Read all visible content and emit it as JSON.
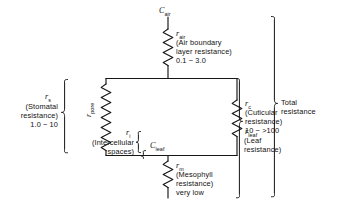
{
  "diagram": {
    "line_color": "#151515",
    "text_color": "#111111",
    "background": "#ffffff",
    "nodes": {
      "c_air": {
        "symbol": "C",
        "subscript": "air"
      },
      "c_leaf": {
        "symbol": "C",
        "subscript": "leaf"
      }
    },
    "resistors": {
      "air": {
        "symbol": "r",
        "subscript": "air",
        "description_line1": "(Air boundary",
        "description_line2": "layer resistance)",
        "value": "0.1 − 3.0"
      },
      "pore": {
        "symbol": "r",
        "subscript": "pore"
      },
      "intercellular": {
        "symbol": "r",
        "subscript": "i",
        "description_line1": "(Intercellular",
        "description_line2": "spaces)"
      },
      "cuticular": {
        "symbol": "r",
        "subscript": "c",
        "description_line1": "(Cuticular",
        "description_line2": "resistance)",
        "value": "10 − >100"
      },
      "mesophyll": {
        "symbol": "r",
        "subscript": "m",
        "description_line1": "(Mesophyll",
        "description_line2": "resistance)",
        "value": "very low"
      }
    },
    "brackets": {
      "stomatal": {
        "symbol": "r",
        "subscript": "s",
        "description_line1": "(Stomatal",
        "description_line2": "resistance)",
        "value": "1.0 − 10"
      },
      "leaf": {
        "symbol": "r",
        "subscript": "leaf",
        "description_line1": "(Leaf",
        "description_line2": "resistance)"
      },
      "total": {
        "description_line1": "Total",
        "description_line2": "resistance"
      }
    }
  }
}
